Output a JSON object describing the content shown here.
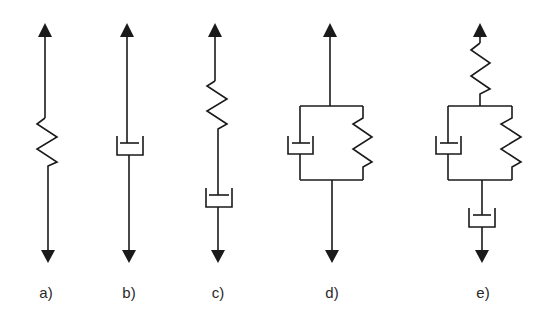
{
  "figure": {
    "panels": [
      {
        "id": "a",
        "label": "a)",
        "model": "spring"
      },
      {
        "id": "b",
        "label": "b)",
        "model": "dashpot"
      },
      {
        "id": "c",
        "label": "c)",
        "model": "spring and dashpot in series (Maxwell)"
      },
      {
        "id": "d",
        "label": "d)",
        "model": "spring and dashpot in parallel (Kelvin-Voigt)"
      },
      {
        "id": "e",
        "label": "e)",
        "model": "spring + (dashpot || spring) + dashpot in series (Burgers)"
      }
    ],
    "colors": {
      "line": "#1a1a1a",
      "background": "#ffffff"
    }
  }
}
